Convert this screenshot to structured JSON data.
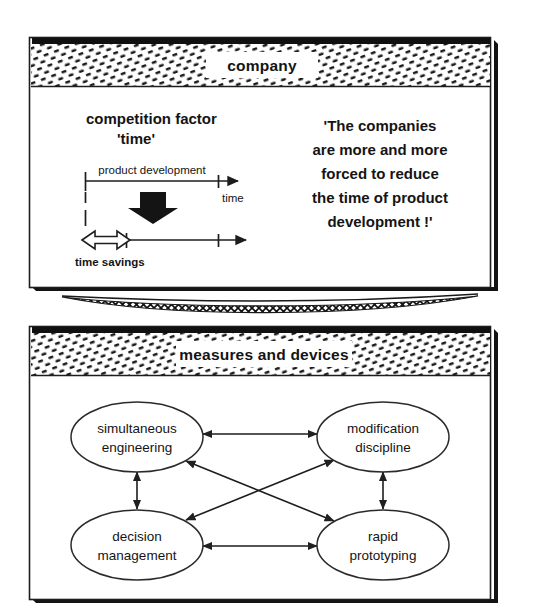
{
  "figure": {
    "panels": [
      {
        "id": "company-panel",
        "title": "company",
        "heading_line1": "competition factor",
        "heading_line2": "'time'",
        "timeline": {
          "top_axis_label": "product development",
          "axis_name": "time",
          "bottom_label": "time savings"
        },
        "quote_lines": [
          "'The companies",
          "are more and more",
          "forced to reduce",
          "the time of product",
          "development !'"
        ]
      },
      {
        "id": "measures-panel",
        "title": "measures and devices",
        "nodes": [
          {
            "id": "simultaneous-engineering",
            "line1": "simultaneous",
            "line2": "engineering"
          },
          {
            "id": "modification-discipline",
            "line1": "modification",
            "line2": "discipline"
          },
          {
            "id": "decision-management",
            "line1": "decision",
            "line2": "management"
          },
          {
            "id": "rapid-prototyping",
            "line1": "rapid",
            "line2": "prototyping"
          }
        ]
      }
    ],
    "colors": {
      "ink": "#141414",
      "line": "#2b2b2b",
      "paper": "#ffffff",
      "shadow": "#111111"
    }
  }
}
